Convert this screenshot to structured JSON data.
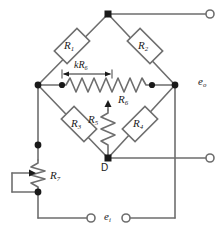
{
  "figure": {
    "type": "circuit-schematic",
    "line_color": "#6e6e6e",
    "ink_color": "#1a1a1a",
    "background": "#ffffff"
  },
  "components": {
    "r1": {
      "label": "R",
      "sub": "1",
      "kind": "resistor-box",
      "x": 72,
      "y": 46,
      "rotation": -45
    },
    "r2": {
      "label": "R",
      "sub": "2",
      "kind": "resistor-box",
      "x": 145,
      "y": 46,
      "rotation": 45
    },
    "r3": {
      "label": "R",
      "sub": "3",
      "kind": "resistor-box",
      "x": 79,
      "y": 124,
      "rotation": 45
    },
    "r4": {
      "label": "R",
      "sub": "4",
      "kind": "resistor-box",
      "x": 140,
      "y": 124,
      "rotation": -45
    },
    "r5": {
      "label": "R",
      "sub": "5",
      "kind": "resistor-zigzag",
      "x": 96,
      "y": 120,
      "orientation": "vertical"
    },
    "r6": {
      "label": "R",
      "sub": "6",
      "kind": "potentiometer-zigzag",
      "x": 124,
      "y": 100,
      "orientation": "horizontal"
    },
    "r7": {
      "label": "R",
      "sub": "7",
      "kind": "potentiometer-zigzag",
      "x": 46,
      "y": 176,
      "orientation": "vertical"
    }
  },
  "annotations": {
    "dimension_k_r6": {
      "label": "kR",
      "sub": "6",
      "x": 77,
      "y": 66
    },
    "node_d": {
      "label": "D",
      "x": 101,
      "y": 163
    }
  },
  "terminals": {
    "output_label": {
      "label": "e",
      "sub": "o",
      "x": 198,
      "y": 78
    },
    "input_label": {
      "label": "e",
      "sub": "i",
      "x": 105,
      "y": 212
    },
    "top_right": {
      "cx": 212,
      "cy": 14,
      "state": "open"
    },
    "mid_right": {
      "cx": 212,
      "cy": 158,
      "state": "open"
    },
    "bottom_left": {
      "cx": 93,
      "cy": 218,
      "state": "open"
    },
    "bottom_right": {
      "cx": 124,
      "cy": 218,
      "state": "open"
    }
  },
  "nodes": {
    "top_apex": {
      "cx": 108,
      "cy": 14
    },
    "left": {
      "cx": 38,
      "cy": 85
    },
    "right": {
      "cx": 175,
      "cy": 85
    },
    "bottom_d": {
      "cx": 108,
      "cy": 158
    },
    "r6_left_tap": {
      "cx": 62,
      "cy": 85
    },
    "r6_right_tap": {
      "cx": 152,
      "cy": 85
    },
    "r7_top": {
      "cx": 38,
      "cy": 145
    },
    "r7_bottom": {
      "cx": 38,
      "cy": 192
    }
  }
}
